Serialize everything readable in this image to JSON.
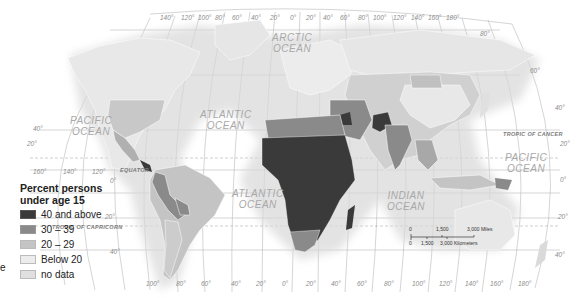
{
  "legend": {
    "title_line1": "Percent persons",
    "title_line2": "under age 15",
    "items": [
      {
        "label": "40 and above",
        "color": "#3a3a3a"
      },
      {
        "label": "30 – 39",
        "color": "#8a8a8a"
      },
      {
        "label": "20 – 29",
        "color": "#c4c4c4"
      },
      {
        "label": "Below 20",
        "color": "#ececec"
      },
      {
        "label": "no data",
        "color": "#e0e0e0"
      }
    ]
  },
  "oceans": {
    "pacific_west_1": "PACIFIC",
    "pacific_west_2": "OCEAN",
    "atlantic_north_1": "ATLANTIC",
    "atlantic_north_2": "OCEAN",
    "arctic_1": "ARCTIC",
    "arctic_2": "OCEAN",
    "atlantic_south_1": "ATLANTIC",
    "atlantic_south_2": "OCEAN",
    "indian_1": "INDIAN",
    "indian_2": "OCEAN",
    "pacific_east_1": "PACIFIC",
    "pacific_east_2": "OCEAN"
  },
  "lines": {
    "equator": "EQUATOR",
    "tropic_cancer": "TROPIC OF CANCER",
    "tropic_capricorn": "TROPIC OF CAPRICORN"
  },
  "top_longitudes": [
    "140°",
    "120°",
    "100°",
    "80°",
    "60°",
    "40°",
    "20°",
    "0°",
    "20°",
    "40°",
    "60°",
    "80°",
    "100°",
    "120°",
    "140°",
    "160°",
    "180°"
  ],
  "bottom_longitudes": [
    "100°",
    "80°",
    "60°",
    "40°",
    "20°",
    "0°",
    "20°",
    "40°",
    "60°",
    "80°",
    "100°",
    "120°",
    "140°",
    "160°",
    "180°"
  ],
  "left_longitudes": [
    "160°",
    "140°",
    "120°"
  ],
  "latitudes_left": {
    "lat40": "40°",
    "lat20": "20°",
    "lat0": "0°",
    "lat20s": "20°",
    "lat40s": "40°"
  },
  "latitudes_right": {
    "lat80": "80°",
    "lat60": "60°",
    "lat40": "40°",
    "lat20": "20°",
    "lat0": "0°",
    "lat20s": "20°",
    "lat40s": "40°"
  },
  "scale": {
    "miles_0": "0",
    "miles_mid": "1,500",
    "miles_end": "3,000 Miles",
    "km_0": "0",
    "km_mid": "1,500",
    "km_end": "3,000 Kilometers"
  },
  "edge_fragment": "e"
}
